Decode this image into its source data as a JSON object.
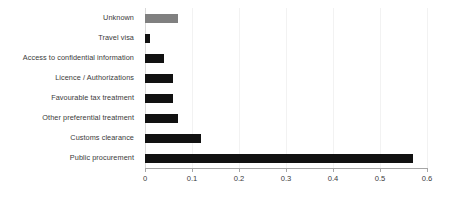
{
  "chart_data": {
    "type": "bar",
    "orientation": "horizontal",
    "title": "",
    "subtitle": "",
    "xlabel": "",
    "ylabel": "",
    "xlim": [
      0,
      0.6
    ],
    "xticks": [
      "0",
      "0.1",
      "0.2",
      "0.3",
      "0.4",
      "0.5",
      "0.6"
    ],
    "xtick_values": [
      0,
      0.1,
      0.2,
      0.3,
      0.4,
      0.5,
      0.6
    ],
    "grid": "vertical-light",
    "legend": "none",
    "annotations": [],
    "categories": [
      "Unknown",
      "Travel visa",
      "Access to confidential information",
      "Licence / Authorizations",
      "Favourable tax treatment",
      "Other preferential treatment",
      "Customs clearance",
      "Public procurement"
    ],
    "values": [
      0.07,
      0.01,
      0.04,
      0.06,
      0.06,
      0.07,
      0.12,
      0.57
    ],
    "bar_colors": [
      "#808080",
      "#111111",
      "#111111",
      "#111111",
      "#111111",
      "#111111",
      "#111111",
      "#111111"
    ]
  },
  "colors": {
    "background": "#ffffff",
    "bar_primary": "#111111",
    "bar_unknown": "#808080",
    "axis": "#a6a6a6",
    "gridline": "#f2f2f2",
    "text": "#3a3a3a"
  }
}
